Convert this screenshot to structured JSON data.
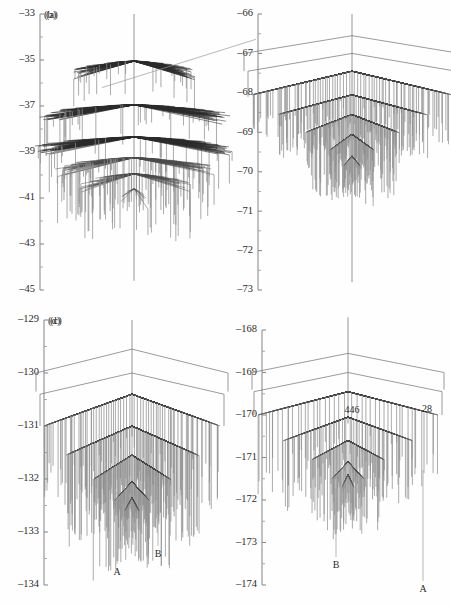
{
  "figure": {
    "width": 451,
    "height": 605,
    "background": "#fefefe",
    "type": "multi-panel-dendrogram-figure"
  },
  "colors": {
    "axis": "#8d8d8d",
    "tick_minor": "#a8a8a8",
    "leaf": "#8f8f8f",
    "branch": "#2a2a2a",
    "hull": "#707070",
    "text": "#2b2b2b"
  },
  "panels": [
    {
      "id": "a",
      "tag": "(a)",
      "x": 6,
      "y": 8,
      "width": 218,
      "height": 296,
      "axis": {
        "x": 34,
        "top": 14,
        "bottom": 290,
        "ymax": -33,
        "ymin": -45,
        "major_ticks": [
          -33,
          -35,
          -37,
          -39,
          -41,
          -43,
          -45
        ],
        "major_labels": [
          "–33",
          "–35",
          "–37",
          "–39",
          "–41",
          "–43",
          "–45"
        ],
        "minor_step": 1
      },
      "tag_pos": {
        "x": 46,
        "y": 16
      },
      "tree": {
        "style": "fan-tiers",
        "center_x": 128,
        "stem_top": -33.0,
        "stem_bottom": -44.6,
        "tiers": [
          {
            "level": -35.05,
            "half_width": 62,
            "n_leaves": 150,
            "leaf_len": 0.95,
            "density": "high"
          },
          {
            "level": -36.95,
            "half_width": 92,
            "n_leaves": 200,
            "leaf_len": 1.15,
            "density": "high"
          },
          {
            "level": -38.35,
            "half_width": 96,
            "n_leaves": 200,
            "leaf_len": 1.25,
            "density": "high"
          },
          {
            "level": -39.25,
            "half_width": 78,
            "n_leaves": 130,
            "leaf_len": 1.5,
            "density": "med"
          },
          {
            "level": -39.95,
            "half_width": 56,
            "n_leaves": 70,
            "leaf_len": 1.7,
            "density": "low"
          },
          {
            "level": -40.6,
            "half_width": 14,
            "n_leaves": 14,
            "leaf_len": 0.9,
            "density": "low"
          }
        ],
        "spur": {
          "from_x": 128,
          "from_y": -34.1,
          "to_x": 96,
          "to_y": -36.2
        }
      },
      "annotations": []
    },
    {
      "id": "b",
      "tag": "(b)",
      "x": 226,
      "y": 8,
      "width": 222,
      "height": 296,
      "axis": {
        "x": 32,
        "top": 14,
        "bottom": 290,
        "ymax": -66,
        "ymin": -73,
        "major_ticks": [
          -66,
          -67,
          -68,
          -69,
          -70,
          -71,
          -72,
          -73
        ],
        "major_labels": [
          "–66",
          "–67",
          "–68",
          "–69",
          "–70",
          "–71",
          "–72",
          "–73"
        ],
        "minor_step": 0.5
      },
      "tag_pos": {
        "x": 44,
        "y": 16
      },
      "tree": {
        "style": "nested-chevron",
        "center_x": 126,
        "stem_top": -66.0,
        "stem_bottom": -72.8,
        "hulls": [
          {
            "apex_y": -66.55,
            "edge_y": -67.0,
            "half_width": 108,
            "drop_to": -67.45
          },
          {
            "apex_y": -67.0,
            "edge_y": -67.45,
            "half_width": 104,
            "drop_to": -68.1
          }
        ],
        "tiers": [
          {
            "level": -67.45,
            "half_width": 100,
            "n_leaves": 90,
            "leaf_top": -68.05,
            "leaf_len": 1.05,
            "block": true
          },
          {
            "level": -68.05,
            "half_width": 74,
            "n_leaves": 90,
            "leaf_top": -68.55,
            "leaf_len": 0.95,
            "block": true
          },
          {
            "level": -68.55,
            "half_width": 46,
            "n_leaves": 110,
            "leaf_top": -69.0,
            "leaf_len": 1.2,
            "block": false
          },
          {
            "level": -69.05,
            "half_width": 22,
            "n_leaves": 60,
            "leaf_top": -69.45,
            "leaf_len": 1.0,
            "block": false
          },
          {
            "level": -69.6,
            "half_width": 8,
            "n_leaves": 20,
            "leaf_top": -69.85,
            "leaf_len": 0.6,
            "block": false
          }
        ]
      },
      "annotations": []
    },
    {
      "id": "c",
      "tag": "(c)",
      "x": 6,
      "y": 312,
      "width": 218,
      "height": 290,
      "axis": {
        "x": 38,
        "top": 320,
        "bottom": 585,
        "ymax": -129,
        "ymin": -134,
        "major_ticks": [
          -129,
          -130,
          -131,
          -132,
          -133,
          -134
        ],
        "major_labels": [
          "–129",
          "–130",
          "–131",
          "–132",
          "–133",
          "–134"
        ],
        "minor_step": 0.5
      },
      "tag_pos": {
        "x": 50,
        "y": 322
      },
      "tree": {
        "style": "nested-chevron",
        "center_x": 126,
        "stem_top": -129.0,
        "stem_bottom": -131.2,
        "hulls": [
          {
            "apex_y": -129.55,
            "edge_y": -130.0,
            "half_width": 96,
            "drop_to": -130.35
          },
          {
            "apex_y": -130.0,
            "edge_y": -130.4,
            "half_width": 92,
            "drop_to": -131.0
          }
        ],
        "tiers": [
          {
            "level": -130.4,
            "half_width": 88,
            "n_leaves": 80,
            "leaf_top": -131.0,
            "leaf_len": 1.3,
            "block": true
          },
          {
            "level": -131.0,
            "half_width": 66,
            "n_leaves": 95,
            "leaf_top": -131.55,
            "leaf_len": 1.4,
            "block": true
          },
          {
            "level": -131.55,
            "half_width": 38,
            "n_leaves": 90,
            "leaf_top": -132.0,
            "leaf_len": 1.25,
            "block": false
          },
          {
            "level": -132.05,
            "half_width": 17,
            "n_leaves": 50,
            "leaf_top": -132.4,
            "leaf_len": 0.9,
            "block": false
          },
          {
            "level": -132.35,
            "half_width": 7,
            "n_leaves": 16,
            "leaf_top": -132.6,
            "leaf_len": 0.5,
            "block": false
          }
        ]
      },
      "annotations": [
        {
          "label": "A",
          "x": 117,
          "y": 573,
          "line_x": 117,
          "line_top": 492,
          "line_bottom": 564
        },
        {
          "label": "B",
          "x": 158,
          "y": 555,
          "line_x": 158,
          "line_top": 478,
          "line_bottom": 546
        }
      ]
    },
    {
      "id": "d",
      "tag": "(d)",
      "x": 226,
      "y": 312,
      "width": 222,
      "height": 290,
      "axis": {
        "x": 36,
        "top": 330,
        "bottom": 585,
        "ymax": -168,
        "ymin": -174,
        "major_ticks": [
          -168,
          -169,
          -170,
          -171,
          -172,
          -173,
          -174
        ],
        "major_labels": [
          "–168",
          "–169",
          "–170",
          "–171",
          "–172",
          "–173",
          "–174"
        ],
        "minor_step": 0.5
      },
      "tag_pos": {
        "x": 48,
        "y": 322
      },
      "tree": {
        "style": "nested-chevron",
        "center_x": 122,
        "stem_top": -167.7,
        "stem_bottom": -170.2,
        "hulls": [
          {
            "apex_y": -168.55,
            "edge_y": -169.0,
            "half_width": 96,
            "drop_to": -169.4
          },
          {
            "apex_y": -169.0,
            "edge_y": -169.45,
            "half_width": 94,
            "drop_to": -170.0
          }
        ],
        "tiers": [
          {
            "level": -169.45,
            "half_width": 90,
            "n_leaves": 46,
            "leaf_top": -170.0,
            "leaf_len": 1.5,
            "block": true
          },
          {
            "level": -170.05,
            "half_width": 64,
            "n_leaves": 54,
            "leaf_top": -170.6,
            "leaf_len": 1.3,
            "block": true
          },
          {
            "level": -170.6,
            "half_width": 36,
            "n_leaves": 60,
            "leaf_top": -171.05,
            "leaf_len": 1.2,
            "block": false
          },
          {
            "level": -171.1,
            "half_width": 16,
            "n_leaves": 34,
            "leaf_top": -171.5,
            "leaf_len": 1.0,
            "block": false
          },
          {
            "level": -171.4,
            "half_width": 6,
            "n_leaves": 12,
            "leaf_top": -171.7,
            "leaf_len": 0.6,
            "block": false
          }
        ]
      },
      "annotations": [
        {
          "label": "446",
          "x": 352,
          "y": 411,
          "line_x": null,
          "line_top": null,
          "line_bottom": null
        },
        {
          "label": "28",
          "x": 427,
          "y": 410,
          "line_x": null,
          "line_top": null,
          "line_bottom": null
        },
        {
          "label": "B",
          "x": 336,
          "y": 566,
          "line_x": 336,
          "line_top": 488,
          "line_bottom": 557
        },
        {
          "label": "A",
          "x": 423,
          "y": 590,
          "line_x": 423,
          "line_top": 470,
          "line_bottom": 581
        }
      ]
    }
  ]
}
